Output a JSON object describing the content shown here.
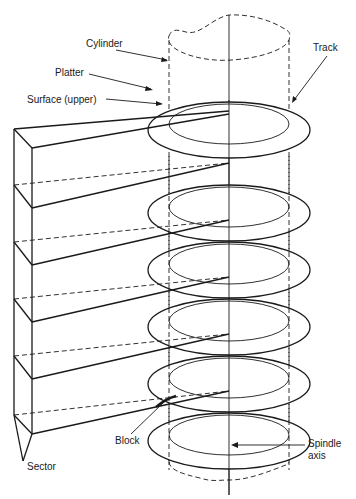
{
  "diagram": {
    "colors": {
      "line": "#1a1a1a",
      "background": "#ffffff"
    },
    "labels": {
      "cylinder": "Cylinder",
      "platter": "Platter",
      "surface": "Surface (upper)",
      "track": "Track",
      "block": "Block",
      "sector": "Sector",
      "spindle_line1": "Spindle",
      "spindle_line2": "axis"
    },
    "platters": [
      {
        "index": 1,
        "center_y": 158
      },
      {
        "index": 2,
        "center_y": 213
      },
      {
        "index": 3,
        "center_y": 270
      },
      {
        "index": 4,
        "center_y": 327
      },
      {
        "index": 5,
        "center_y": 384
      },
      {
        "index": 6,
        "center_y": 441
      }
    ],
    "platter_count": 6
  }
}
